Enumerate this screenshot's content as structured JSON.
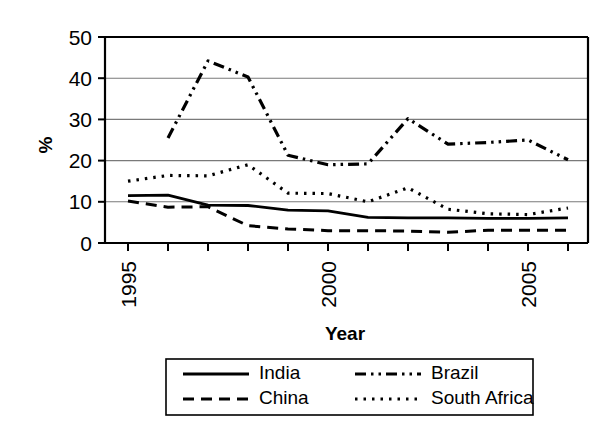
{
  "chart_data": {
    "type": "line",
    "title": "",
    "xlabel": "Year",
    "ylabel": "%",
    "xlim": [
      1995,
      2006
    ],
    "ylim": [
      0,
      50
    ],
    "grid": true,
    "legend_position": "bottom",
    "x": [
      1995,
      1996,
      1997,
      1998,
      1999,
      2000,
      2001,
      2002,
      2003,
      2004,
      2005,
      2006
    ],
    "y_ticks": [
      "0",
      "10",
      "20",
      "30",
      "40",
      "50"
    ],
    "y_tick_values": [
      0,
      10,
      20,
      30,
      40,
      50
    ],
    "x_tick_labels": [
      "1995",
      "2000",
      "2005"
    ],
    "x_tick_label_values": [
      1995,
      2000,
      2005
    ],
    "series": [
      {
        "name": "India",
        "style": "solid",
        "values": [
          11.5,
          11.6,
          9.2,
          9.1,
          8.0,
          7.8,
          6.2,
          6.1,
          6.1,
          6.0,
          6.0,
          6.1
        ]
      },
      {
        "name": "China",
        "style": "dashed",
        "values": [
          10.2,
          8.7,
          8.8,
          4.2,
          3.4,
          3.0,
          3.0,
          2.9,
          2.6,
          3.1,
          3.1,
          3.1
        ]
      },
      {
        "name": "Brazil",
        "style": "dash-dot-dot",
        "values": [
          null,
          25.5,
          44.2,
          40.3,
          21.3,
          19.0,
          19.2,
          30.2,
          24.0,
          24.4,
          25.0,
          20.2
        ]
      },
      {
        "name": "South Africa",
        "style": "dotted",
        "values": [
          15.0,
          16.4,
          16.3,
          19.0,
          12.1,
          12.0,
          10.0,
          13.4,
          8.2,
          7.1,
          6.9,
          8.5
        ]
      }
    ]
  },
  "axes": {
    "y_title": "%",
    "x_title": "Year",
    "y_labels": [
      "50",
      "40",
      "30",
      "20",
      "10",
      "0"
    ],
    "x_labels": [
      "1995",
      "2000",
      "2005"
    ]
  },
  "legend": {
    "entries": [
      {
        "label": "India",
        "style": "solid"
      },
      {
        "label": "Brazil",
        "style": "dash-dot-dot"
      },
      {
        "label": "China",
        "style": "dashed"
      },
      {
        "label": "South Africa",
        "style": "dotted"
      }
    ]
  }
}
